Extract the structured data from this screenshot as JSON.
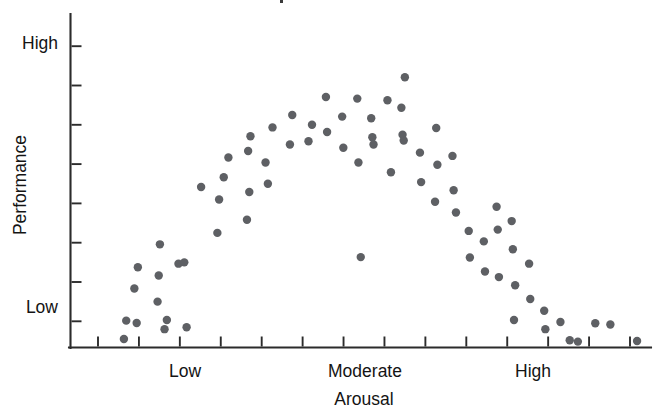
{
  "figure": {
    "kind": "scatter-plot",
    "background_color": "#ffffff",
    "point_color": "#5e6064",
    "axis_color": "#2b2b2b",
    "text_color": "#141414"
  },
  "chart_data": {
    "type": "scatter",
    "title": "",
    "xlabel": "Arousal",
    "ylabel": "Performance",
    "grid": false,
    "legend": null,
    "xlim": [
      0,
      100
    ],
    "ylim": [
      0,
      100
    ],
    "x_tick_labels": [
      "Low",
      "Moderate",
      "High"
    ],
    "x_tick_label_positions": [
      19.5,
      50.5,
      79.5
    ],
    "x_tick_count": 14,
    "y_tick_labels": [
      "Low",
      "High"
    ],
    "y_tick_label_positions": [
      8,
      92
    ],
    "y_tick_count": 8,
    "points": [
      [
        9.6,
        8.2
      ],
      [
        9.2,
        2.6
      ],
      [
        11.4,
        7.5
      ],
      [
        11.0,
        18.0
      ],
      [
        11.6,
        24.5
      ],
      [
        15.2,
        22.0
      ],
      [
        15.4,
        31.5
      ],
      [
        15.0,
        14.0
      ],
      [
        16.6,
        8.4
      ],
      [
        16.2,
        5.6
      ],
      [
        18.6,
        25.6
      ],
      [
        19.6,
        26.0
      ],
      [
        20.0,
        6.2
      ],
      [
        22.5,
        49.0
      ],
      [
        25.3,
        35.0
      ],
      [
        25.6,
        45.2
      ],
      [
        26.4,
        52.0
      ],
      [
        27.2,
        58.0
      ],
      [
        30.6,
        60.0
      ],
      [
        30.8,
        47.5
      ],
      [
        30.4,
        39.0
      ],
      [
        31.0,
        64.5
      ],
      [
        33.6,
        56.5
      ],
      [
        34.0,
        50.0
      ],
      [
        34.8,
        67.2
      ],
      [
        37.8,
        62.0
      ],
      [
        38.2,
        71.0
      ],
      [
        41.6,
        68.0
      ],
      [
        41.0,
        63.0
      ],
      [
        44.0,
        76.5
      ],
      [
        44.2,
        65.8
      ],
      [
        46.8,
        70.5
      ],
      [
        47.0,
        61.0
      ],
      [
        49.4,
        76.0
      ],
      [
        49.6,
        56.5
      ],
      [
        50.0,
        27.6
      ],
      [
        51.8,
        70.0
      ],
      [
        52.0,
        64.2
      ],
      [
        52.2,
        62.0
      ],
      [
        54.6,
        75.5
      ],
      [
        55.2,
        53.5
      ],
      [
        57.0,
        73.2
      ],
      [
        57.2,
        65.0
      ],
      [
        57.4,
        63.2
      ],
      [
        57.6,
        82.5
      ],
      [
        60.2,
        59.5
      ],
      [
        60.4,
        50.5
      ],
      [
        63.0,
        67.0
      ],
      [
        63.2,
        55.8
      ],
      [
        62.8,
        44.5
      ],
      [
        65.8,
        58.5
      ],
      [
        66.0,
        48.0
      ],
      [
        66.4,
        41.2
      ],
      [
        68.6,
        35.6
      ],
      [
        68.8,
        27.5
      ],
      [
        71.2,
        32.4
      ],
      [
        71.4,
        23.2
      ],
      [
        73.4,
        43.0
      ],
      [
        73.6,
        36.0
      ],
      [
        73.8,
        21.5
      ],
      [
        76.0,
        38.6
      ],
      [
        76.2,
        30.0
      ],
      [
        76.6,
        19.0
      ],
      [
        76.4,
        8.4
      ],
      [
        79.0,
        25.6
      ],
      [
        79.2,
        14.8
      ],
      [
        81.6,
        11.2
      ],
      [
        81.8,
        5.6
      ],
      [
        84.4,
        7.8
      ],
      [
        86.0,
        2.2
      ],
      [
        87.4,
        1.8
      ],
      [
        90.4,
        7.4
      ],
      [
        93.0,
        7.0
      ],
      [
        97.6,
        2.0
      ]
    ]
  }
}
